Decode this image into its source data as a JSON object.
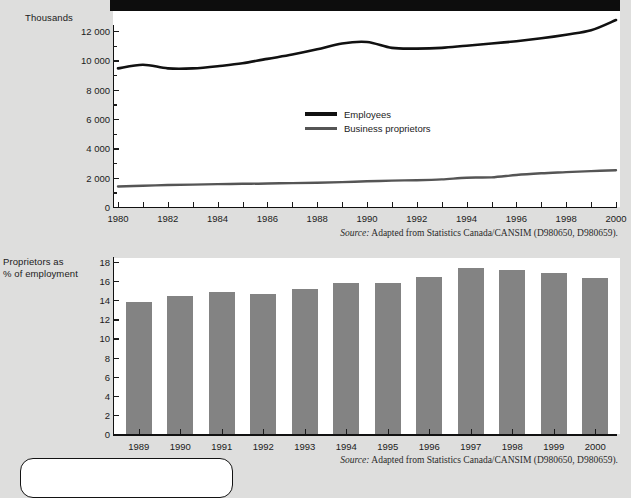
{
  "page": {
    "background_color": "#dededd",
    "panel_color": "#ffffff",
    "ink_color": "#111111",
    "bar_color": "#838383"
  },
  "line_chart": {
    "axis_title": "Thousands",
    "y_ticks": [
      "12 000",
      "10 000",
      "8 000",
      "6 000",
      "4 000",
      "2 000",
      "0"
    ],
    "x_ticks": [
      "1980",
      "1982",
      "1984",
      "1986",
      "1988",
      "1990",
      "1992",
      "1994",
      "1996",
      "1998",
      "2000"
    ],
    "legend": [
      {
        "label": "Employees",
        "color": "#111111"
      },
      {
        "label": "Business proprietors",
        "color": "#555555"
      }
    ],
    "source": "Adapted from Statistics Canada/CANSIM (D980650, D980659).",
    "source_prefix": "Source:"
  },
  "bar_chart": {
    "axis_title_line1": "Proprietors as",
    "axis_title_line2": "% of employment",
    "y_ticks": [
      "18",
      "16",
      "14",
      "12",
      "10",
      "8",
      "6",
      "4",
      "2",
      "0"
    ],
    "source": "Adapted from Statistics Canada/CANSIM (D980650, D980659).",
    "source_prefix": "Source:"
  },
  "chart_data": [
    {
      "type": "line",
      "title": "Employees and business proprietors",
      "xlabel": "",
      "ylabel": "Thousands",
      "ylim": [
        0,
        13000
      ],
      "xlim": [
        1980,
        2000
      ],
      "grid": false,
      "legend_position": "inside-center",
      "x": [
        1980,
        1981,
        1982,
        1983,
        1984,
        1985,
        1986,
        1987,
        1988,
        1989,
        1990,
        1991,
        1992,
        1993,
        1994,
        1995,
        1996,
        1997,
        1998,
        1999,
        2000
      ],
      "series": [
        {
          "name": "Employees",
          "color": "#111111",
          "values": [
            9450,
            9700,
            9450,
            9450,
            9600,
            9800,
            10100,
            10400,
            10750,
            11150,
            11250,
            10850,
            10800,
            10850,
            11000,
            11150,
            11300,
            11500,
            11750,
            12050,
            12750
          ]
        },
        {
          "name": "Business proprietors",
          "color": "#555555",
          "values": [
            1400,
            1450,
            1500,
            1530,
            1560,
            1580,
            1600,
            1630,
            1660,
            1700,
            1750,
            1800,
            1830,
            1880,
            2000,
            2020,
            2180,
            2300,
            2380,
            2450,
            2500
          ]
        }
      ]
    },
    {
      "type": "bar",
      "title": "Proprietors as % of employment",
      "xlabel": "",
      "ylabel": "Proprietors as % of employment",
      "ylim": [
        0,
        18
      ],
      "grid": false,
      "categories": [
        "1989",
        "1990",
        "1991",
        "1992",
        "1993",
        "1994",
        "1995",
        "1996",
        "1997",
        "1998",
        "1999",
        "2000"
      ],
      "values": [
        13.8,
        14.4,
        14.9,
        14.7,
        15.2,
        15.8,
        15.8,
        16.4,
        17.4,
        17.2,
        16.8,
        16.3
      ]
    }
  ]
}
